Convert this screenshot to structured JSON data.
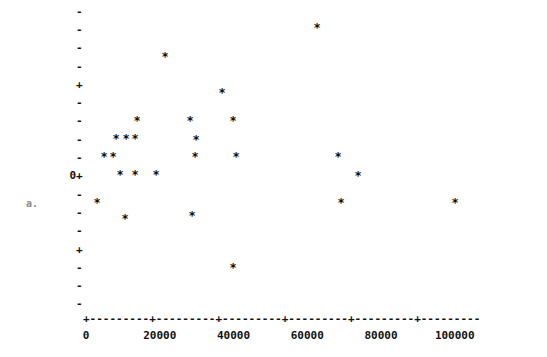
{
  "chart_data": {
    "type": "scatter",
    "title": "",
    "subtitle": "",
    "xlabel": "",
    "ylabel": "",
    "marker": "*",
    "grid": false,
    "legend": null,
    "xlim": [
      -4000,
      121000
    ],
    "ylim": [
      -8.5,
      8.5
    ],
    "xticks": [
      0,
      20000,
      40000,
      60000,
      80000,
      100000
    ],
    "xticklabels": [
      "0",
      "20000",
      "40000",
      "60000",
      "80000",
      "100000"
    ],
    "yticks": [
      8,
      7,
      6,
      5,
      4,
      3,
      2,
      1,
      0,
      -1,
      -2,
      -3,
      -4,
      -5,
      -6,
      -7,
      -8
    ],
    "yticklabels": [
      "-",
      "-",
      "-",
      "-",
      "+",
      "-",
      "-",
      "-",
      "-",
      "0+",
      "-",
      "-",
      "-",
      "+",
      "-",
      "-",
      "-"
    ],
    "y_axis_caption": "a.",
    "x": [
      8100,
      11000,
      13500,
      8100,
      10800,
      17000,
      12200,
      16000,
      24000,
      22700,
      29300,
      28000,
      29000,
      38500,
      41000,
      40500,
      43500,
      40800,
      5400,
      13000,
      68500,
      69500,
      72000,
      69000,
      112000
    ],
    "y": [
      1,
      1,
      1,
      0,
      0,
      3,
      -1,
      -1,
      5,
      -1,
      2,
      1,
      0,
      3,
      2,
      -3,
      0,
      -6,
      -3,
      -4,
      7,
      0,
      -1,
      -3,
      -3
    ],
    "points": [
      {
        "x": 8100,
        "y": 1,
        "px": 116,
        "py": 139
      },
      {
        "x": 11000,
        "y": 1,
        "px": 126,
        "py": 139
      },
      {
        "x": 13500,
        "y": 1,
        "px": 135,
        "py": 139
      },
      {
        "x": 8100,
        "y": 0,
        "px": 104,
        "py": 157
      },
      {
        "x": 10800,
        "y": 0,
        "px": 113,
        "py": 157
      },
      {
        "x": 17000,
        "y": 3,
        "px": 137,
        "py": 121
      },
      {
        "x": 12200,
        "y": -1,
        "px": 120,
        "py": 175
      },
      {
        "x": 16000,
        "y": -1,
        "px": 135,
        "py": 175
      },
      {
        "x": 24000,
        "y": 5,
        "px": 165,
        "py": 57
      },
      {
        "x": 22700,
        "y": -1,
        "px": 156,
        "py": 175
      },
      {
        "x": 29300,
        "y": 2,
        "px": 190,
        "py": 121
      },
      {
        "x": 28000,
        "y": 1,
        "px": 196,
        "py": 140
      },
      {
        "x": 29000,
        "y": 0,
        "px": 195,
        "py": 157
      },
      {
        "x": 38500,
        "y": 3,
        "px": 222,
        "py": 93
      },
      {
        "x": 41000,
        "y": 2,
        "px": 233,
        "py": 121
      },
      {
        "x": 40500,
        "y": -3,
        "px": 192,
        "py": 216
      },
      {
        "x": 43500,
        "y": 0,
        "px": 236,
        "py": 157
      },
      {
        "x": 40800,
        "y": -6,
        "px": 233,
        "py": 268
      },
      {
        "x": 5400,
        "y": -3,
        "px": 97,
        "py": 203
      },
      {
        "x": 13000,
        "y": -4,
        "px": 125,
        "py": 219
      },
      {
        "x": 68500,
        "y": 7,
        "px": 317,
        "py": 28
      },
      {
        "x": 69500,
        "y": 0,
        "px": 338,
        "py": 157
      },
      {
        "x": 72000,
        "y": -1,
        "px": 358,
        "py": 176
      },
      {
        "x": 69000,
        "y": -3,
        "px": 341,
        "py": 203
      },
      {
        "x": 112000,
        "y": -3,
        "px": 455,
        "py": 203
      }
    ]
  },
  "axis": {
    "x_axis_line": "+---------+---------+---------+---------+---------+---------",
    "y_origin_label": "0+",
    "y_plus_label": "+",
    "y_dash_label": "-",
    "caption": "a."
  }
}
